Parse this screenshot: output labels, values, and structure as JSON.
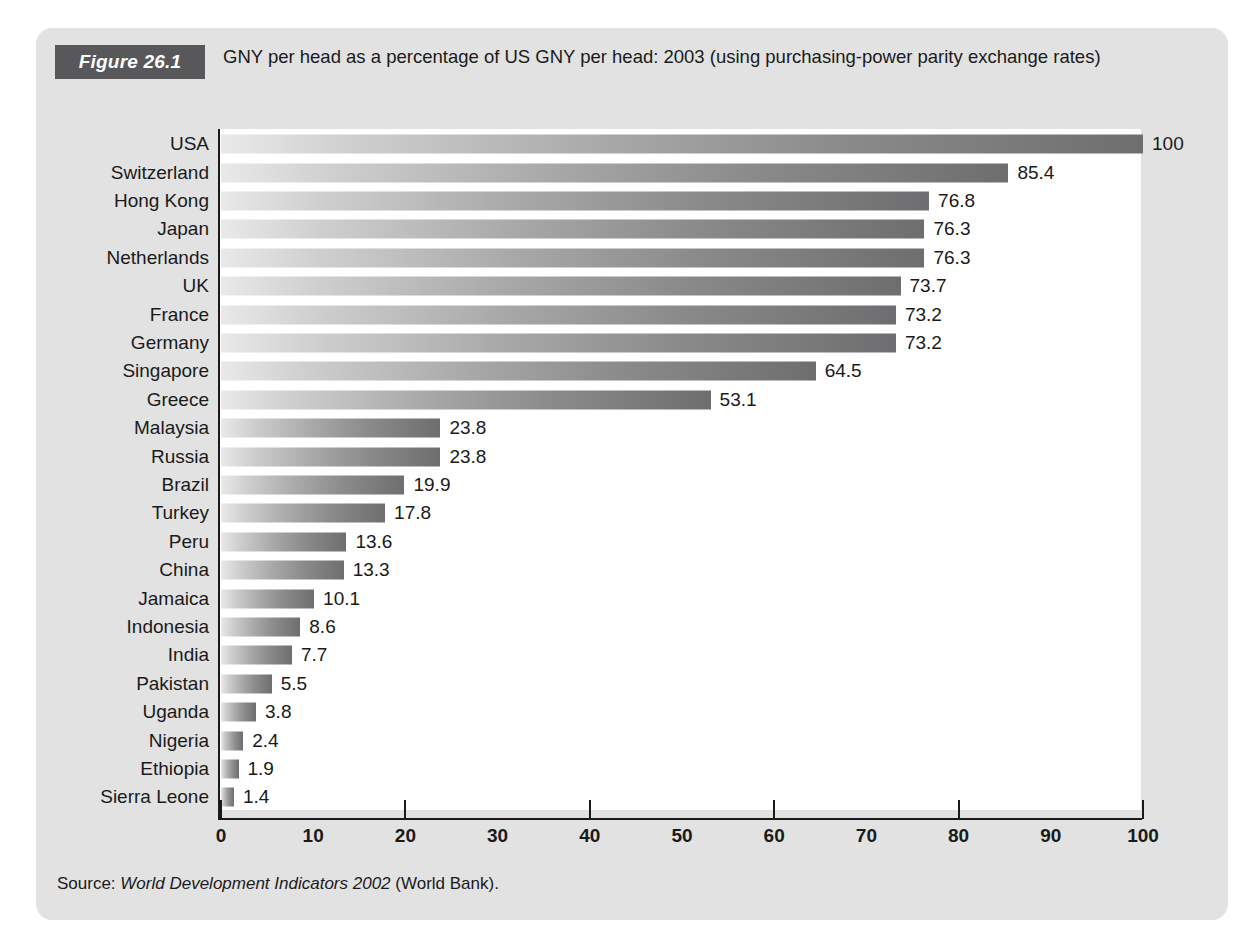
{
  "figure": {
    "badge_label": "Figure 26.1",
    "title": "GNY per head as  a percentage of US GNY per head: 2003 (using purchasing-power parity exchange rates)",
    "source_prefix": "Source: ",
    "source_italic": "World Development Indicators 2002",
    "source_suffix": " (World Bank).",
    "badge_bg": "#58585a",
    "panel_bg": "#e2e2e2",
    "plot_bg": "#ffffff",
    "bar_gradient_start": "#e9e9e9",
    "bar_gradient_end": "#6e6e70",
    "axis_color": "#1a1a1a"
  },
  "chart_data": {
    "type": "bar",
    "orientation": "horizontal",
    "title": "GNY per head as  a percentage of US GNY per head: 2003 (using purchasing-power parity exchange rates)",
    "xlabel": "",
    "ylabel": "",
    "xlim": [
      0,
      100
    ],
    "xticks": [
      0,
      10,
      20,
      30,
      40,
      50,
      60,
      70,
      80,
      90,
      100
    ],
    "xtick_labels": [
      "0",
      "10",
      "20",
      "30",
      "40",
      "50",
      "60",
      "70",
      "80",
      "90",
      "100"
    ],
    "major_tick_marks": [
      0,
      20,
      40,
      60,
      80,
      100
    ],
    "grid": false,
    "legend": null,
    "categories": [
      "USA",
      "Switzerland",
      "Hong Kong",
      "Japan",
      "Netherlands",
      "UK",
      "France",
      "Germany",
      "Singapore",
      "Greece",
      "Malaysia",
      "Russia",
      "Brazil",
      "Turkey",
      "Peru",
      "China",
      "Jamaica",
      "Indonesia",
      "India",
      "Pakistan",
      "Uganda",
      "Nigeria",
      "Ethiopia",
      "Sierra Leone"
    ],
    "values": [
      100,
      85.4,
      76.8,
      76.3,
      76.3,
      73.7,
      73.2,
      73.2,
      64.5,
      53.1,
      23.8,
      23.8,
      19.9,
      17.8,
      13.6,
      13.3,
      10.1,
      8.6,
      7.7,
      5.5,
      3.8,
      2.4,
      1.9,
      1.4
    ],
    "value_labels": [
      "100",
      "85.4",
      "76.8",
      "76.3",
      "76.3",
      "73.7",
      "73.2",
      "73.2",
      "64.5",
      "53.1",
      "23.8",
      "23.8",
      "19.9",
      "17.8",
      "13.6",
      "13.3",
      "10.1",
      "8.6",
      "7.7",
      "5.5",
      "3.8",
      "2.4",
      "1.9",
      "1.4"
    ]
  }
}
